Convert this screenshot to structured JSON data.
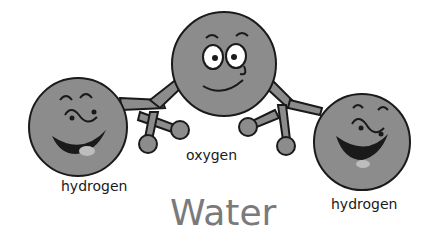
{
  "diagram": {
    "title": "Water",
    "atoms": [
      {
        "name": "hydrogen",
        "label": "hydrogen",
        "position": "left"
      },
      {
        "name": "oxygen",
        "label": "oxygen",
        "position": "center"
      },
      {
        "name": "hydrogen",
        "label": "hydrogen",
        "position": "right"
      }
    ],
    "colors": {
      "atom_fill": "#8c8c8c",
      "outline": "#1a1a1a",
      "title": "#7a7a7a"
    }
  }
}
